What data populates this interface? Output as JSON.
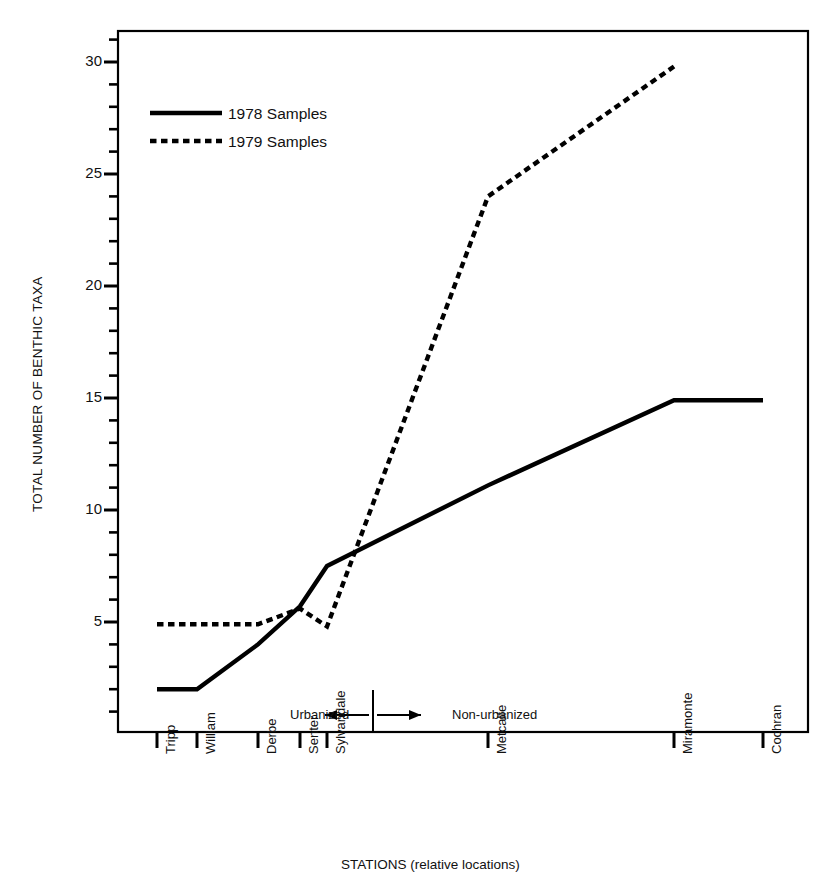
{
  "chart_data": {
    "type": "line",
    "title": "",
    "xlabel": "STATIONS  (relative locations)",
    "ylabel": "TOTAL NUMBER OF BENTHIC TAXA",
    "categories": [
      "Tripp",
      "William",
      "Derbe",
      "Senter",
      "Sylvandale",
      "Metcalfe",
      "Miramonte",
      "Cochran"
    ],
    "x_positions_relative": [
      157,
      197,
      258,
      300,
      327,
      488,
      674,
      763
    ],
    "ylim": [
      0,
      31
    ],
    "yticks_major": [
      5,
      10,
      15,
      20,
      25,
      30
    ],
    "ytick_labels": [
      "5",
      "10",
      "15",
      "20",
      "25",
      "30"
    ],
    "minor_tick_step": 1,
    "grid": false,
    "legend_position": "upper-left-inside",
    "series": [
      {
        "name": "1978 Samples",
        "style": "solid",
        "color": "#000000",
        "values": [
          2.0,
          2.0,
          4.0,
          5.7,
          7.5,
          11.1,
          14.9,
          14.9
        ]
      },
      {
        "name": "1979 Samples",
        "style": "dashed",
        "color": "#000000",
        "values": [
          4.9,
          4.9,
          4.9,
          5.6,
          4.8,
          24.0,
          29.8,
          null
        ]
      }
    ],
    "annotations": {
      "divider_label_left": "Urbanized",
      "divider_label_right": "Non-urbanized",
      "divider_x_relative": 373,
      "divider_arrow": "double-headed"
    }
  },
  "legend": {
    "items": [
      {
        "label": "1978 Samples",
        "style": "solid"
      },
      {
        "label": "1979 Samples",
        "style": "dashed"
      }
    ]
  },
  "axes": {
    "y_title": "TOTAL NUMBER OF BENTHIC TAXA",
    "x_title": "STATIONS  (relative locations)",
    "y_tick_labels": [
      "30",
      "25",
      "20",
      "15",
      "10",
      "5"
    ],
    "x_tick_labels": [
      "Tripp",
      "William",
      "Derbe",
      "Senter",
      "Sylvandale",
      "Metcalfe",
      "Miramonte",
      "Cochran"
    ]
  },
  "zone": {
    "left": "Urbanized",
    "right": "Non-urbanized"
  },
  "colors": {
    "ink": "#000000",
    "background": "#ffffff"
  }
}
